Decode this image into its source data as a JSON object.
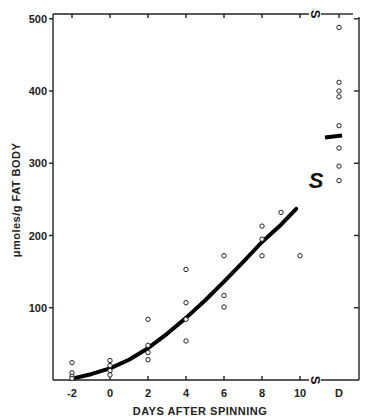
{
  "chart_data": {
    "type": "scatter",
    "title": "",
    "xlabel": "DAYS  AFTER SPINNING",
    "ylabel": "μmoles/g FAT BODY",
    "xlim": [
      -2.5,
      12.5
    ],
    "ylim": [
      0,
      510
    ],
    "x_ticks": [
      -2,
      0,
      2,
      4,
      6,
      8,
      10
    ],
    "x_tick_labels": [
      "-2",
      "0",
      "2",
      "4",
      "6",
      "8",
      "10",
      "D"
    ],
    "y_ticks": [
      100,
      200,
      300,
      400,
      500
    ],
    "y_tick_labels": [
      "100",
      "200",
      "300",
      "400",
      "500"
    ],
    "grid": false,
    "legend": null,
    "annotations": [
      {
        "text": "S",
        "role": "axis-break marker",
        "position": "top axis between 10 and D"
      },
      {
        "text": "S",
        "role": "axis-break marker",
        "position": "bottom axis between 10 and D"
      },
      {
        "text": "S",
        "role": "large break marker",
        "position": "between curve end and D column, ~y 270"
      }
    ],
    "series": [
      {
        "name": "individual measurements",
        "style": "open circles",
        "points": [
          {
            "x": -2,
            "y": 24
          },
          {
            "x": -2,
            "y": 10
          },
          {
            "x": -2,
            "y": 5
          },
          {
            "x": -2,
            "y": 2
          },
          {
            "x": 0,
            "y": 27
          },
          {
            "x": 0,
            "y": 20
          },
          {
            "x": 0,
            "y": 13
          },
          {
            "x": 0,
            "y": 7
          },
          {
            "x": 2,
            "y": 84
          },
          {
            "x": 2,
            "y": 48
          },
          {
            "x": 2,
            "y": 38
          },
          {
            "x": 2,
            "y": 28
          },
          {
            "x": 4,
            "y": 153
          },
          {
            "x": 4,
            "y": 107
          },
          {
            "x": 4,
            "y": 84
          },
          {
            "x": 4,
            "y": 54
          },
          {
            "x": 6,
            "y": 172
          },
          {
            "x": 6,
            "y": 117
          },
          {
            "x": 6,
            "y": 101
          },
          {
            "x": 8,
            "y": 213
          },
          {
            "x": 8,
            "y": 195
          },
          {
            "x": 8,
            "y": 172
          },
          {
            "x": 9,
            "y": 232
          },
          {
            "x": 10,
            "y": 172
          },
          {
            "x": "D",
            "y": 488
          },
          {
            "x": "D",
            "y": 412
          },
          {
            "x": "D",
            "y": 400
          },
          {
            "x": "D",
            "y": 392
          },
          {
            "x": "D",
            "y": 352
          },
          {
            "x": "D",
            "y": 321
          },
          {
            "x": "D",
            "y": 296
          },
          {
            "x": "D",
            "y": 276
          }
        ]
      },
      {
        "name": "fitted curve",
        "style": "thick solid line",
        "points": [
          {
            "x": -2,
            "y": 2
          },
          {
            "x": -1,
            "y": 8
          },
          {
            "x": 0,
            "y": 16
          },
          {
            "x": 1,
            "y": 28
          },
          {
            "x": 2,
            "y": 44
          },
          {
            "x": 3,
            "y": 64
          },
          {
            "x": 4,
            "y": 86
          },
          {
            "x": 5,
            "y": 110
          },
          {
            "x": 6,
            "y": 136
          },
          {
            "x": 7,
            "y": 163
          },
          {
            "x": 8,
            "y": 191
          },
          {
            "x": 9,
            "y": 215
          },
          {
            "x": 9.8,
            "y": 237
          }
        ]
      },
      {
        "name": "mean at D",
        "style": "short thick bar",
        "points": [
          {
            "x": "D",
            "y": 337
          }
        ]
      }
    ]
  }
}
